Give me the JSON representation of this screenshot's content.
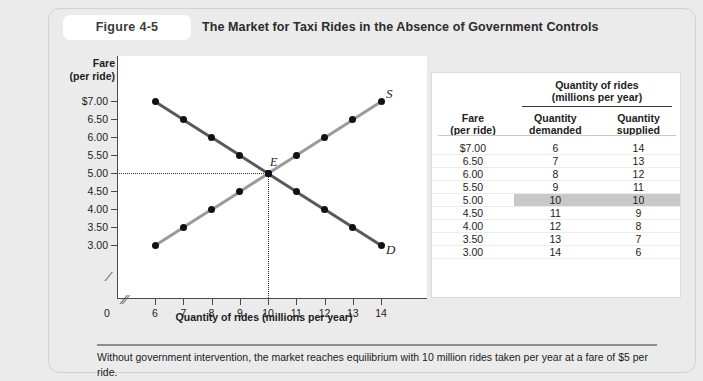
{
  "figure": {
    "number": "Figure 4-5",
    "title": "The Market for Taxi Rides in the Absence of Government Controls",
    "caption": "Without government intervention, the market reaches equilibrium with 10 million rides taken per year at a fare of $5 per ride."
  },
  "table": {
    "span_header": "Quantity of rides",
    "span_subheader": "(millions per year)",
    "col_fare": "Fare",
    "col_fare_sub": "(per ride)",
    "col_demanded": "Quantity",
    "col_demanded_sub": "demanded",
    "col_supplied": "Quantity",
    "col_supplied_sub": "supplied",
    "rows": [
      {
        "fare": "$7.00",
        "demanded": "6",
        "supplied": "14",
        "highlight": false
      },
      {
        "fare": "6.50",
        "demanded": "7",
        "supplied": "13",
        "highlight": false
      },
      {
        "fare": "6.00",
        "demanded": "8",
        "supplied": "12",
        "highlight": false
      },
      {
        "fare": "5.50",
        "demanded": "9",
        "supplied": "11",
        "highlight": false
      },
      {
        "fare": "5.00",
        "demanded": "10",
        "supplied": "10",
        "highlight": true
      },
      {
        "fare": "4.50",
        "demanded": "11",
        "supplied": "9",
        "highlight": false
      },
      {
        "fare": "4.00",
        "demanded": "12",
        "supplied": "8",
        "highlight": false
      },
      {
        "fare": "3.50",
        "demanded": "13",
        "supplied": "7",
        "highlight": false
      },
      {
        "fare": "3.00",
        "demanded": "14",
        "supplied": "6",
        "highlight": false
      }
    ]
  },
  "chart_data": {
    "type": "line",
    "title": "The Market for Taxi Rides in the Absence of Government Controls",
    "xlabel": "Quantity of rides (millions per year)",
    "ylabel": "Fare",
    "ylabel_sub": "(per ride)",
    "origin_label": "0",
    "x_ticks": [
      6,
      7,
      8,
      9,
      10,
      11,
      12,
      13,
      14
    ],
    "x_tick_labels": [
      "6",
      "7",
      "8",
      "9",
      "10",
      "11",
      "12",
      "13",
      "14"
    ],
    "y_ticks": [
      3.0,
      3.5,
      4.0,
      4.5,
      5.0,
      5.5,
      6.0,
      6.5,
      7.0
    ],
    "y_tick_labels": [
      "3.00",
      "3.50",
      "4.00",
      "4.50",
      "5.00",
      "5.50",
      "6.00",
      "6.50",
      "$7.00"
    ],
    "xlim": [
      6,
      14
    ],
    "ylim": [
      3.0,
      7.0
    ],
    "axis_break_x": true,
    "axis_break_y": true,
    "grid": false,
    "series": [
      {
        "name": "D",
        "label": "D",
        "color": "#595959",
        "x": [
          6,
          7,
          8,
          9,
          10,
          11,
          12,
          13,
          14
        ],
        "y": [
          7.0,
          6.5,
          6.0,
          5.5,
          5.0,
          4.5,
          4.0,
          3.5,
          3.0
        ]
      },
      {
        "name": "S",
        "label": "S",
        "color": "#9a9a9a",
        "x": [
          6,
          7,
          8,
          9,
          10,
          11,
          12,
          13,
          14
        ],
        "y": [
          3.0,
          3.5,
          4.0,
          4.5,
          5.0,
          5.5,
          6.0,
          6.5,
          7.0
        ]
      }
    ],
    "annotations": [
      {
        "label": "E",
        "x": 10,
        "y": 5.0,
        "note": "equilibrium point with dotted guide lines to both axes"
      }
    ]
  }
}
